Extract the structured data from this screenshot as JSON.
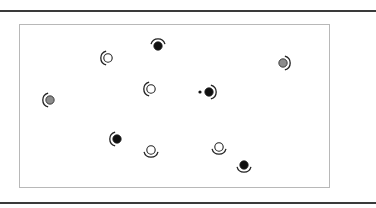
{
  "figure": {
    "rules": [
      {
        "y": 10
      },
      {
        "y": 202
      }
    ],
    "frame": {
      "x": 19,
      "y": 24,
      "width": 311,
      "height": 164,
      "border_color": "#b8b8b8"
    },
    "colors": {
      "black": "#111111",
      "gray": "#8c8c8c",
      "white": "#ffffff",
      "stroke": "#222222"
    },
    "symbols": [
      {
        "id": "s1",
        "x": 108,
        "y": 58,
        "fill": "white",
        "arc": "left"
      },
      {
        "id": "s2",
        "x": 158,
        "y": 46,
        "fill": "black",
        "arc": "top"
      },
      {
        "id": "s3",
        "x": 283,
        "y": 63,
        "fill": "gray",
        "arc": "right"
      },
      {
        "id": "s4",
        "x": 151,
        "y": 89,
        "fill": "white",
        "arc": "left"
      },
      {
        "id": "s5",
        "x": 209,
        "y": 92,
        "fill": "black",
        "arc": "right"
      },
      {
        "id": "s6",
        "x": 50,
        "y": 100,
        "fill": "gray",
        "arc": "left"
      },
      {
        "id": "s7",
        "x": 117,
        "y": 139,
        "fill": "black",
        "arc": "left"
      },
      {
        "id": "s8",
        "x": 151,
        "y": 150,
        "fill": "white",
        "arc": "bottom"
      },
      {
        "id": "s9",
        "x": 219,
        "y": 147,
        "fill": "white",
        "arc": "bottom"
      },
      {
        "id": "s10",
        "x": 244,
        "y": 165,
        "fill": "black",
        "arc": "bottom"
      }
    ],
    "dots": [
      {
        "id": "d1",
        "x": 200,
        "y": 92
      }
    ]
  }
}
